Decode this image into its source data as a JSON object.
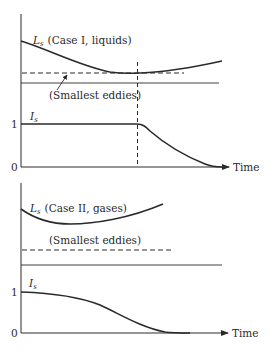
{
  "figure": {
    "panels": [
      {
        "id": "case-1",
        "curve_label_symbol": "L",
        "curve_label_subscript": "s",
        "curve_label_text": "(Case I, liquids)",
        "eddies_label": "(Smallest eddies)",
        "intensity_symbol": "I",
        "intensity_subscript": "s",
        "tick_one": "1",
        "tick_zero": "0",
        "x_axis_label": "Time"
      },
      {
        "id": "case-2",
        "curve_label_symbol": "L",
        "curve_label_subscript": "s",
        "curve_label_text": "(Case II, gases)",
        "eddies_label": "(Smallest eddies)",
        "intensity_symbol": "I",
        "intensity_subscript": "s",
        "tick_one": "1",
        "tick_zero": "0",
        "x_axis_label": "Time"
      }
    ],
    "colors": {
      "ink": "#2a2a2a",
      "background": "#ffffff"
    }
  }
}
